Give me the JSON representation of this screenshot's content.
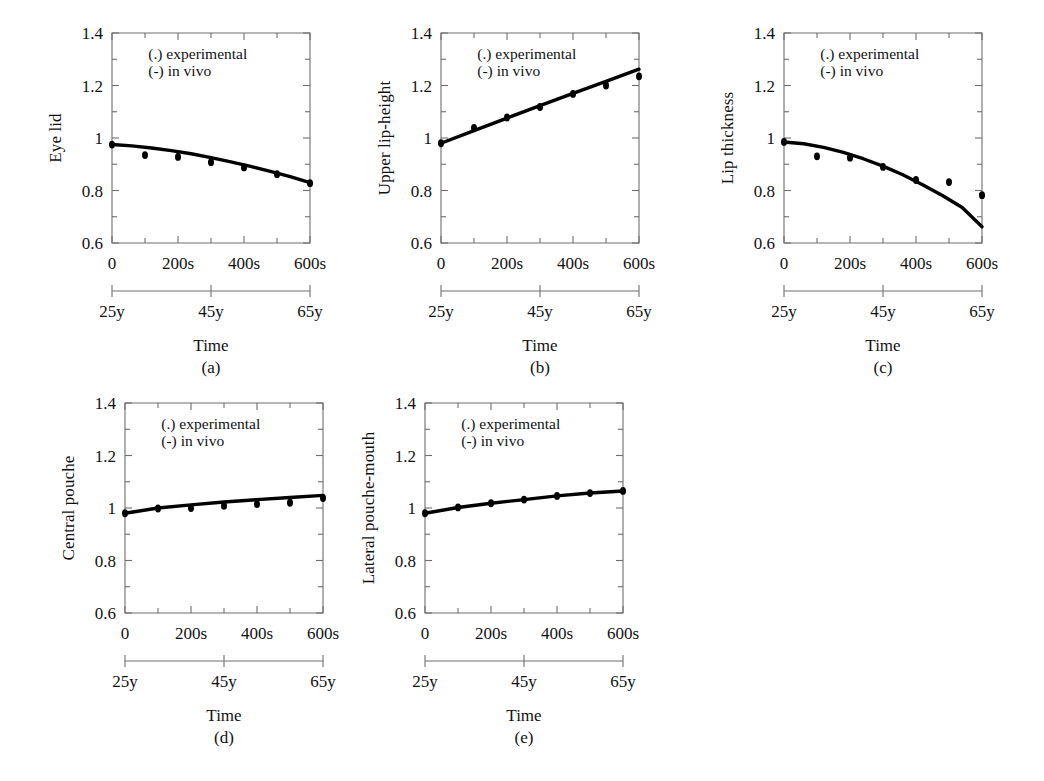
{
  "figure": {
    "background": "#ffffff",
    "line_color": "#000000",
    "axis_color": "#6f6f6f",
    "legend": {
      "experimental": "(.) experimental",
      "in_vivo": "(-) in vivo"
    },
    "time_axis_label": "Time",
    "y_ticks": [
      "1.4",
      "1.2",
      "1",
      "0.8",
      "0.6"
    ],
    "x_ticks": [
      "0",
      "200s",
      "400s",
      "600s"
    ],
    "age_ticks": [
      "25y",
      "45y",
      "65y"
    ]
  },
  "chart_data": [
    {
      "type": "line",
      "panel": "(a)",
      "title": "Eye lid",
      "ylabel": "Eye lid",
      "xlabel": "Time",
      "ylim": [
        0.6,
        1.4
      ],
      "xlim": [
        0,
        600
      ],
      "xtick_values": [
        0,
        200,
        400,
        600
      ],
      "xtick_labels": [
        "0",
        "200s",
        "400s",
        "600s"
      ],
      "ytick_values": [
        0.6,
        0.8,
        1.0,
        1.2,
        1.4
      ],
      "ytick_labels": [
        "0.6",
        "0.8",
        "1",
        "1.2",
        "1.4"
      ],
      "age_tick_values": [
        0,
        300,
        600
      ],
      "age_tick_labels": [
        "25y",
        "45y",
        "65y"
      ],
      "grid": false,
      "legend_position": "top-left-inside",
      "series": [
        {
          "name": "in vivo",
          "style": "line",
          "x": [
            0,
            60,
            120,
            180,
            240,
            300,
            360,
            420,
            480,
            540,
            600
          ],
          "values": [
            0.975,
            0.97,
            0.962,
            0.952,
            0.94,
            0.925,
            0.909,
            0.892,
            0.873,
            0.853,
            0.83
          ]
        },
        {
          "name": "experimental",
          "style": "points",
          "x": [
            0,
            100,
            200,
            300,
            400,
            500,
            600
          ],
          "values": [
            0.975,
            0.935,
            0.928,
            0.908,
            0.888,
            0.862,
            0.828
          ]
        }
      ]
    },
    {
      "type": "line",
      "panel": "(b)",
      "title": "Upper lip-height",
      "ylabel": "Upper lip-height",
      "xlabel": "Time",
      "ylim": [
        0.6,
        1.4
      ],
      "xlim": [
        0,
        600
      ],
      "xtick_values": [
        0,
        200,
        400,
        600
      ],
      "xtick_labels": [
        "0",
        "200s",
        "400s",
        "600s"
      ],
      "ytick_values": [
        0.6,
        0.8,
        1.0,
        1.2,
        1.4
      ],
      "ytick_labels": [
        "0.6",
        "0.8",
        "1",
        "1.2",
        "1.4"
      ],
      "age_tick_values": [
        0,
        300,
        600
      ],
      "age_tick_labels": [
        "25y",
        "45y",
        "65y"
      ],
      "grid": false,
      "legend_position": "top-left-inside",
      "series": [
        {
          "name": "in vivo",
          "style": "line",
          "x": [
            0,
            100,
            200,
            300,
            400,
            500,
            600
          ],
          "values": [
            0.98,
            1.028,
            1.076,
            1.123,
            1.17,
            1.216,
            1.262
          ]
        },
        {
          "name": "experimental",
          "style": "points",
          "x": [
            0,
            100,
            200,
            300,
            400,
            500,
            600
          ],
          "values": [
            0.98,
            1.038,
            1.078,
            1.118,
            1.168,
            1.2,
            1.235
          ]
        }
      ]
    },
    {
      "type": "line",
      "panel": "(c)",
      "title": "Lip thickness",
      "ylabel": "Lip thickness",
      "xlabel": "Time",
      "ylim": [
        0.6,
        1.4
      ],
      "xlim": [
        0,
        600
      ],
      "xtick_values": [
        0,
        200,
        400,
        600
      ],
      "xtick_labels": [
        "0",
        "200s",
        "400s",
        "600s"
      ],
      "ytick_values": [
        0.6,
        0.8,
        1.0,
        1.2,
        1.4
      ],
      "ytick_labels": [
        "0.6",
        "0.8",
        "1",
        "1.2",
        "1.4"
      ],
      "age_tick_values": [
        0,
        300,
        600
      ],
      "age_tick_labels": [
        "25y",
        "45y",
        "65y"
      ],
      "grid": false,
      "legend_position": "top-left-inside",
      "series": [
        {
          "name": "in vivo",
          "style": "line",
          "x": [
            0,
            60,
            120,
            180,
            240,
            300,
            360,
            420,
            480,
            540,
            600
          ],
          "values": [
            0.985,
            0.978,
            0.964,
            0.945,
            0.921,
            0.893,
            0.86,
            0.822,
            0.781,
            0.735,
            0.662
          ]
        },
        {
          "name": "experimental",
          "style": "points",
          "x": [
            0,
            100,
            200,
            300,
            400,
            500,
            600
          ],
          "values": [
            0.985,
            0.93,
            0.925,
            0.89,
            0.84,
            0.832,
            0.782
          ]
        }
      ]
    },
    {
      "type": "line",
      "panel": "(d)",
      "title": "Central pouche",
      "ylabel": "Central pouche",
      "xlabel": "Time",
      "ylim": [
        0.6,
        1.4
      ],
      "xlim": [
        0,
        600
      ],
      "xtick_values": [
        0,
        200,
        400,
        600
      ],
      "xtick_labels": [
        "0",
        "200s",
        "400s",
        "600s"
      ],
      "ytick_values": [
        0.6,
        0.8,
        1.0,
        1.2,
        1.4
      ],
      "ytick_labels": [
        "0.6",
        "0.8",
        "1",
        "1.2",
        "1.4"
      ],
      "age_tick_values": [
        0,
        300,
        600
      ],
      "age_tick_labels": [
        "25y",
        "45y",
        "65y"
      ],
      "grid": false,
      "legend_position": "top-left-inside",
      "series": [
        {
          "name": "in vivo",
          "style": "line",
          "x": [
            0,
            100,
            200,
            300,
            400,
            500,
            600
          ],
          "values": [
            0.98,
            1.0,
            1.012,
            1.023,
            1.032,
            1.04,
            1.048
          ]
        },
        {
          "name": "experimental",
          "style": "points",
          "x": [
            0,
            100,
            200,
            300,
            400,
            500,
            600
          ],
          "values": [
            0.98,
            0.998,
            1.0,
            1.008,
            1.015,
            1.02,
            1.038
          ]
        }
      ]
    },
    {
      "type": "line",
      "panel": "(e)",
      "title": "Lateral pouche-mouth",
      "ylabel": "Lateral pouche-mouth",
      "xlabel": "Time",
      "ylim": [
        0.6,
        1.4
      ],
      "xlim": [
        0,
        600
      ],
      "xtick_values": [
        0,
        200,
        400,
        600
      ],
      "xtick_labels": [
        "0",
        "200s",
        "400s",
        "600s"
      ],
      "ytick_values": [
        0.6,
        0.8,
        1.0,
        1.2,
        1.4
      ],
      "ytick_labels": [
        "0.6",
        "0.8",
        "1",
        "1.2",
        "1.4"
      ],
      "age_tick_values": [
        0,
        300,
        600
      ],
      "age_tick_labels": [
        "25y",
        "45y",
        "65y"
      ],
      "grid": false,
      "legend_position": "top-left-inside",
      "series": [
        {
          "name": "in vivo",
          "style": "line",
          "x": [
            0,
            100,
            200,
            300,
            400,
            500,
            600
          ],
          "values": [
            0.98,
            1.002,
            1.018,
            1.032,
            1.046,
            1.057,
            1.065
          ]
        },
        {
          "name": "experimental",
          "style": "points",
          "x": [
            0,
            100,
            200,
            300,
            400,
            500,
            600
          ],
          "values": [
            0.98,
            1.002,
            1.018,
            1.032,
            1.046,
            1.057,
            1.065
          ]
        }
      ]
    }
  ],
  "panels": [
    {
      "letter": "(a)",
      "ylabel": "Eye lid",
      "xlabel": "Time"
    },
    {
      "letter": "(b)",
      "ylabel": "Upper lip-height",
      "xlabel": "Time"
    },
    {
      "letter": "(c)",
      "ylabel": "Lip thickness",
      "xlabel": "Time"
    },
    {
      "letter": "(d)",
      "ylabel": "Central pouche",
      "xlabel": "Time"
    },
    {
      "letter": "(e)",
      "ylabel": "Lateral pouche-mouth",
      "xlabel": "Time"
    }
  ]
}
